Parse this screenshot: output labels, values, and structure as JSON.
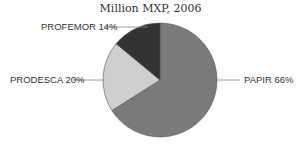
{
  "chart_data": {
    "type": "pie",
    "title": "Million MXP, 2006",
    "slices": [
      {
        "label": "PAPIR",
        "value": 66,
        "display": "PAPIR 66%",
        "color": "#7a7a7a"
      },
      {
        "label": "PRODESCA",
        "value": 20,
        "display": "PRODESCA 20%",
        "color": "#cfcfcf"
      },
      {
        "label": "PROFEMOR",
        "value": 14,
        "display": "PROFEMOR 14%",
        "color": "#333333"
      }
    ]
  }
}
